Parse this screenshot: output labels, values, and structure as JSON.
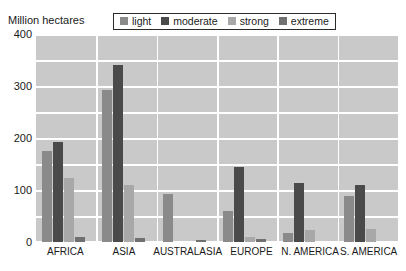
{
  "chart_data": {
    "type": "bar",
    "title": "",
    "subtitle": "",
    "xlabel": "",
    "ylabel": "Million hectares",
    "ylim": [
      0,
      400
    ],
    "yticks": [
      0,
      100,
      200,
      300,
      400
    ],
    "grid": true,
    "legend_position": "top-center",
    "categories": [
      "AFRICA",
      "ASIA",
      "AUSTRALASIA",
      "EUROPE",
      "N. AMERICA",
      "S. AMERICA"
    ],
    "series": [
      {
        "name": "light",
        "color": "#8a8a8a",
        "values": [
          175,
          292,
          93,
          60,
          18,
          88
        ]
      },
      {
        "name": "moderate",
        "color": "#4a4a4a",
        "values": [
          192,
          341,
          0,
          145,
          113,
          110
        ]
      },
      {
        "name": "strong",
        "color": "#a8a8a8",
        "values": [
          124,
          110,
          0,
          10,
          24,
          25
        ]
      },
      {
        "name": "extreme",
        "color": "#707070",
        "values": [
          10,
          8,
          4,
          5,
          0,
          0
        ]
      }
    ]
  },
  "axis": {
    "y_title": "Million hectares",
    "y_tick_labels": [
      "400",
      "300",
      "200",
      "100",
      "0"
    ],
    "x_tick_labels": [
      "AFRICA",
      "ASIA",
      "AUSTRALASIA",
      "EUROPE",
      "N. AMERICA",
      "S. AMERICA"
    ]
  },
  "legend": {
    "items": [
      {
        "label": "light",
        "color": "#8a8a8a"
      },
      {
        "label": "moderate",
        "color": "#4a4a4a"
      },
      {
        "label": "strong",
        "color": "#a8a8a8"
      },
      {
        "label": "extreme",
        "color": "#707070"
      }
    ]
  },
  "style": {
    "plot_background": "#c9c9c9",
    "gridline_color": "#ffffff",
    "page_background": "#ffffff",
    "text_color": "#1a1a1a"
  }
}
